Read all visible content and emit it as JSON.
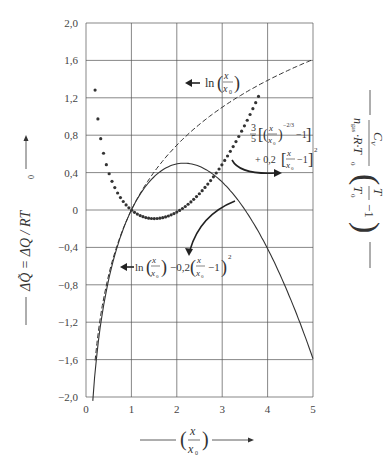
{
  "chart_data": {
    "type": "line",
    "title": "",
    "xlabel": "(x / x0)",
    "ylabel_left": "ΔQ̃ = ΔQ / RT0",
    "ylabel_right": "Cv / (n_gas·R·T0) · (T/T0 − 1)",
    "xlim": [
      0,
      5
    ],
    "ylim": [
      -2.0,
      2.0
    ],
    "grid": true,
    "x_ticks": [
      "0",
      "1",
      "2",
      "3",
      "4",
      "5"
    ],
    "y_ticks": [
      "2,0",
      "1,6",
      "1,2",
      "0,8",
      "0,4",
      "0",
      "-0,4",
      "-0,8",
      "-1,2",
      "-1,6",
      "-2,0"
    ],
    "series": [
      {
        "name": "ln(x/x0)",
        "style": "dashed",
        "x": [
          0.2,
          0.3,
          0.5,
          0.75,
          1.0,
          1.5,
          2.0,
          2.5,
          3.0,
          3.5,
          4.0,
          4.5,
          5.0
        ],
        "values": [
          -1.61,
          -1.2,
          -0.69,
          -0.29,
          0.0,
          0.41,
          0.69,
          0.92,
          1.1,
          1.25,
          1.39,
          1.5,
          1.61
        ]
      },
      {
        "name": "3/5[(x/x0)^(-2/3) - 1] + 0,2[x/x0 - 1]^2",
        "style": "dotted",
        "x": [
          0.2,
          0.3,
          0.5,
          0.75,
          1.0,
          1.5,
          2.0,
          2.5,
          3.0,
          3.5,
          3.8
        ],
        "values": [
          1.28,
          0.84,
          0.4,
          0.12,
          0.0,
          -0.09,
          -0.02,
          0.16,
          0.41,
          0.74,
          1.21
        ]
      },
      {
        "name": "ln(x/x0) - 0,2(x/x0 - 1)^2",
        "style": "solid",
        "x": [
          0.15,
          0.3,
          0.5,
          0.75,
          1.0,
          1.5,
          2.0,
          2.5,
          3.0,
          3.5,
          4.0,
          4.5,
          5.0
        ],
        "values": [
          -1.79,
          -1.3,
          -0.74,
          -0.3,
          0.0,
          0.36,
          0.49,
          0.47,
          0.3,
          0.0,
          -0.41,
          -0.94,
          -1.59
        ]
      }
    ],
    "annotations": [
      {
        "text": "ln(x/x0)",
        "arrow": "left",
        "x": 2.2,
        "y": 1.25
      },
      {
        "text": "3/5[(x/x0)^(-2/3) - 1] + 0,2[x/x0 - 1]^2",
        "arrow": "curved-right",
        "x": 3.2,
        "y": 0.75
      },
      {
        "text": "ln(x/x0) - 0,2(x/x0 - 1)^2",
        "arrow": "left",
        "x": 0.9,
        "y": -0.65
      }
    ]
  },
  "labels": {
    "left_axis": "ΔQ̃ = ΔQ / RT",
    "left_axis_sub": "0",
    "bottom_axis_num": "x",
    "bottom_axis_den": "x",
    "bottom_axis_den_sub": "0",
    "right_num": "C",
    "right_num_sub": "V",
    "right_den": "n",
    "right_den_sub": "gas",
    "right_den_rest": "·R·T",
    "right_den_sub2": "0",
    "right_frac_num": "T",
    "right_frac_den": "T",
    "right_frac_den_sub": "0",
    "right_minus_one": "−1",
    "ann_ln": "ln",
    "ann_x": "x",
    "ann_x0": "x",
    "ann_x0_sub": "0",
    "ann_dot_coef": "3",
    "ann_dot_coef_den": "5",
    "ann_dot_exp": "−2/3",
    "ann_dot_m1": "−1",
    "ann_dot_plus": "+ 0,2",
    "ann_dot_sq": "2",
    "ann_solid_mid": "−0,2",
    "ann_solid_m1": "−1",
    "ann_solid_sq": "2"
  },
  "colors": {
    "axis": "#444444",
    "grid": "#555555",
    "curve": "#333333"
  }
}
